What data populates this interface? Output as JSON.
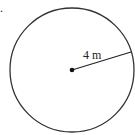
{
  "diagram": {
    "shape": "circle",
    "radius_label": "4 m",
    "marker": ".",
    "colors": {
      "stroke": "#333333",
      "background": "#ffffff"
    }
  }
}
